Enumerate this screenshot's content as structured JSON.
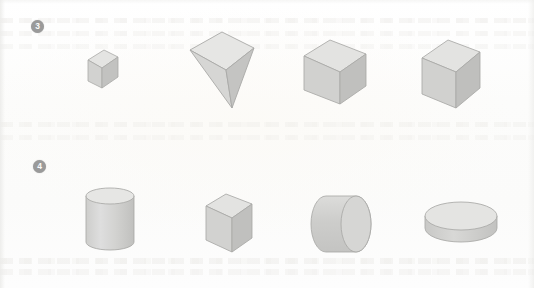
{
  "page": {
    "width": 534,
    "height": 288,
    "background_color": "#fdfdfc"
  },
  "palette": {
    "marker_fill": "#9a9a9a",
    "marker_text": "#fafafa",
    "solid_top_face": "#e2e2e0",
    "solid_front_face": "#cfcfcd",
    "solid_side_face": "#bdbdbb",
    "solid_outline": "#a8a8a6",
    "paper": "#fdfdfc",
    "ghost_text": "#e4e2de"
  },
  "rows": [
    {
      "marker": "3",
      "marker_name": "item-number-3",
      "shapes": [
        {
          "name": "small-cube",
          "label": "cube",
          "index": 1
        },
        {
          "name": "inverted-pyramid",
          "label": "square pyramid",
          "index": 2
        },
        {
          "name": "wide-rectangular-prism",
          "label": "rectangular prism",
          "index": 3
        },
        {
          "name": "tall-rectangular-prism",
          "label": "rectangular prism",
          "index": 4
        }
      ]
    },
    {
      "marker": "4",
      "marker_name": "item-number-4",
      "shapes": [
        {
          "name": "upright-cylinder",
          "label": "cylinder",
          "index": 1
        },
        {
          "name": "narrow-rectangular-prism",
          "label": "rectangular prism",
          "index": 2
        },
        {
          "name": "horizontal-cylinder",
          "label": "cylinder",
          "index": 3
        },
        {
          "name": "flat-disc-cylinder",
          "label": "cylinder",
          "index": 4
        }
      ]
    }
  ]
}
